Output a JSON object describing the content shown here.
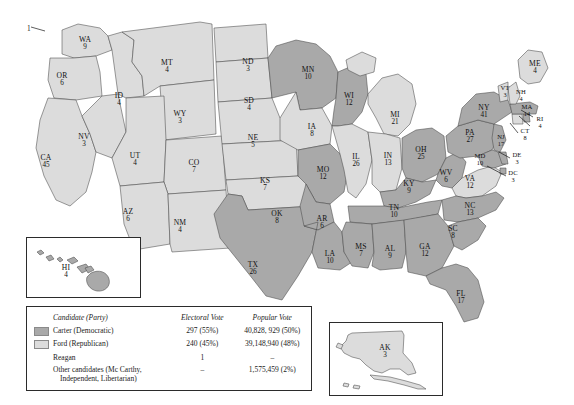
{
  "elector_note": "1",
  "colors": {
    "carter": "#a9a9a9",
    "ford": "#dcdcdc",
    "border": "#4a4a4a"
  },
  "legend": {
    "headers": {
      "candidate": "Candidate (Party)",
      "electoral": "Electoral Vote",
      "popular": "Popular Vote"
    },
    "rows": [
      {
        "swatch": "carter",
        "candidate": "Carter (Democratic)",
        "electoral": "297 (55%)",
        "popular": "40,828, 929 (50%)"
      },
      {
        "swatch": "ford",
        "candidate": "Ford (Republican)",
        "electoral": "240 (45%)",
        "popular": "39,148,940 (48%)"
      },
      {
        "swatch": "none",
        "candidate": "Reagan",
        "electoral": "1",
        "popular": "–"
      },
      {
        "swatch": "none",
        "candidate": "Other candidates (Mc Carthy,",
        "candidate2": "Independent, Libertarian)",
        "electoral": "–",
        "popular": "1,575,459 (2%)"
      }
    ]
  },
  "insets": {
    "hawaii_label": "HI",
    "alaska_label": "AK"
  },
  "chart_data": {
    "type": "map",
    "legend_position": "bottom-left",
    "categories": [
      "Carter (Democratic)",
      "Ford (Republican)"
    ],
    "totals": {
      "carter_electoral": 297,
      "carter_electoral_pct": "55%",
      "carter_popular": "40,828,929",
      "carter_popular_pct": "50%",
      "ford_electoral": 240,
      "ford_electoral_pct": "45%",
      "ford_popular": "39,148,940",
      "ford_popular_pct": "48%",
      "reagan_electoral": 1,
      "other_popular": "1,575,459",
      "other_popular_pct": "2%"
    },
    "states": [
      {
        "ab": "WA",
        "ev": 9,
        "winner": "ford",
        "x": 85,
        "y": 44
      },
      {
        "ab": "OR",
        "ev": 6,
        "winner": "ford",
        "x": 62,
        "y": 80
      },
      {
        "ab": "CA",
        "ev": 45,
        "winner": "ford",
        "x": 46,
        "y": 162
      },
      {
        "ab": "NV",
        "ev": 3,
        "winner": "ford",
        "x": 84,
        "y": 141
      },
      {
        "ab": "ID",
        "ev": 4,
        "winner": "ford",
        "x": 119,
        "y": 100
      },
      {
        "ab": "MT",
        "ev": 4,
        "winner": "ford",
        "x": 167,
        "y": 67
      },
      {
        "ab": "WY",
        "ev": 3,
        "winner": "ford",
        "x": 180,
        "y": 118
      },
      {
        "ab": "UT",
        "ev": 4,
        "winner": "ford",
        "x": 135,
        "y": 160
      },
      {
        "ab": "AZ",
        "ev": 6,
        "winner": "ford",
        "x": 128,
        "y": 216
      },
      {
        "ab": "CO",
        "ev": 7,
        "winner": "ford",
        "x": 194,
        "y": 167
      },
      {
        "ab": "NM",
        "ev": 4,
        "winner": "ford",
        "x": 180,
        "y": 227
      },
      {
        "ab": "ND",
        "ev": 3,
        "winner": "ford",
        "x": 248,
        "y": 66
      },
      {
        "ab": "SD",
        "ev": 4,
        "winner": "ford",
        "x": 249,
        "y": 105
      },
      {
        "ab": "NE",
        "ev": 5,
        "winner": "ford",
        "x": 253,
        "y": 142
      },
      {
        "ab": "KS",
        "ev": 7,
        "winner": "ford",
        "x": 265,
        "y": 185
      },
      {
        "ab": "OK",
        "ev": 8,
        "winner": "ford",
        "x": 277,
        "y": 218
      },
      {
        "ab": "TX",
        "ev": 26,
        "winner": "carter",
        "x": 253,
        "y": 269
      },
      {
        "ab": "MN",
        "ev": 10,
        "winner": "carter",
        "x": 308,
        "y": 74
      },
      {
        "ab": "IA",
        "ev": 8,
        "winner": "ford",
        "x": 312,
        "y": 131
      },
      {
        "ab": "MO",
        "ev": 12,
        "winner": "carter",
        "x": 323,
        "y": 174
      },
      {
        "ab": "AR",
        "ev": 6,
        "winner": "carter",
        "x": 322,
        "y": 223
      },
      {
        "ab": "LA",
        "ev": 10,
        "winner": "carter",
        "x": 330,
        "y": 258
      },
      {
        "ab": "WI",
        "ev": 12,
        "winner": "carter",
        "x": 349,
        "y": 100
      },
      {
        "ab": "IL",
        "ev": 26,
        "winner": "ford",
        "x": 356,
        "y": 161
      },
      {
        "ab": "MS",
        "ev": 7,
        "winner": "carter",
        "x": 361,
        "y": 251
      },
      {
        "ab": "MI",
        "ev": 21,
        "winner": "ford",
        "x": 395,
        "y": 119
      },
      {
        "ab": "IN",
        "ev": 13,
        "winner": "ford",
        "x": 388,
        "y": 160
      },
      {
        "ab": "KY",
        "ev": 9,
        "winner": "carter",
        "x": 409,
        "y": 188
      },
      {
        "ab": "TN",
        "ev": 10,
        "winner": "carter",
        "x": 394,
        "y": 212
      },
      {
        "ab": "AL",
        "ev": 9,
        "winner": "carter",
        "x": 390,
        "y": 253
      },
      {
        "ab": "GA",
        "ev": 12,
        "winner": "carter",
        "x": 425,
        "y": 251
      },
      {
        "ab": "FL",
        "ev": 17,
        "winner": "carter",
        "x": 461,
        "y": 298
      },
      {
        "ab": "OH",
        "ev": 25,
        "winner": "carter",
        "x": 421,
        "y": 154
      },
      {
        "ab": "WV",
        "ev": 6,
        "winner": "carter",
        "x": 446,
        "y": 177
      },
      {
        "ab": "VA",
        "ev": 12,
        "winner": "ford",
        "x": 470,
        "y": 183
      },
      {
        "ab": "NC",
        "ev": 13,
        "winner": "carter",
        "x": 470,
        "y": 210
      },
      {
        "ab": "SC",
        "ev": 8,
        "winner": "carter",
        "x": 453,
        "y": 233
      },
      {
        "ab": "PA",
        "ev": 27,
        "winner": "carter",
        "x": 470,
        "y": 137
      },
      {
        "ab": "NY",
        "ev": 41,
        "winner": "carter",
        "x": 484,
        "y": 112
      },
      {
        "ab": "MD",
        "ev": 10,
        "winner": "carter",
        "x": 480,
        "y": 160
      },
      {
        "ab": "DE",
        "ev": 3,
        "winner": "carter",
        "x": 517,
        "y": 159
      },
      {
        "ab": "DC",
        "ev": 3,
        "winner": "carter",
        "x": 513,
        "y": 177
      },
      {
        "ab": "NJ",
        "ev": 17,
        "winner": "carter",
        "x": 501,
        "y": 141
      },
      {
        "ab": "CT",
        "ev": 8,
        "winner": "ford",
        "x": 525,
        "y": 135
      },
      {
        "ab": "RI",
        "ev": 4,
        "winner": "carter",
        "x": 540,
        "y": 123
      },
      {
        "ab": "MA",
        "ev": 14,
        "winner": "carter",
        "x": 527,
        "y": 111
      },
      {
        "ab": "NH",
        "ev": 4,
        "winner": "ford",
        "x": 521,
        "y": 96
      },
      {
        "ab": "VT",
        "ev": 3,
        "winner": "ford",
        "x": 505,
        "y": 92
      },
      {
        "ab": "ME",
        "ev": 4,
        "winner": "ford",
        "x": 535,
        "y": 68
      },
      {
        "ab": "HI",
        "ev": 4,
        "winner": "carter",
        "x": 66,
        "y": 272
      },
      {
        "ab": "AK",
        "ev": 3,
        "winner": "ford",
        "x": 385,
        "y": 352
      }
    ]
  }
}
